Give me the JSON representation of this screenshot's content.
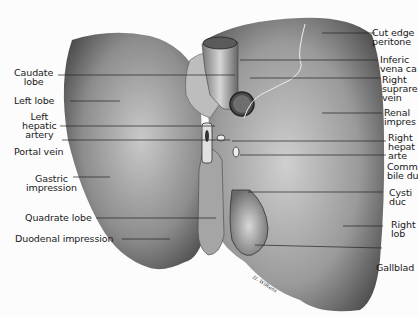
{
  "figure": {
    "signature": "H. Wilkens",
    "colors": {
      "background": "#fcfcfc",
      "organ_dark": "#3a3a3a",
      "organ_mid": "#8a8a8a",
      "organ_light": "#c8c8c8",
      "text": "#1a1a1a"
    }
  },
  "labels_left": [
    {
      "id": "caudate-lobe",
      "text": "Caudate\nlobe"
    },
    {
      "id": "left-lobe",
      "text": "Left lobe"
    },
    {
      "id": "left-hepatic-artery",
      "text": "Left\nhepatic\nartery"
    },
    {
      "id": "portal-vein",
      "text": "Portal vein"
    },
    {
      "id": "gastric-impression",
      "text": "Gastric\nimpression"
    },
    {
      "id": "quadrate-lobe",
      "text": "Quadrate lobe"
    },
    {
      "id": "duodenal-impression",
      "text": "Duodenal impression"
    }
  ],
  "labels_right": [
    {
      "id": "cut-edge-peritoneum",
      "text": "Cut edge\nperitone"
    },
    {
      "id": "inferior-vena-cava",
      "text": "Inferic\nvena ca"
    },
    {
      "id": "right-suprarenal-vein",
      "text": "Right\nsuprare\nvein"
    },
    {
      "id": "renal-impression",
      "text": "Renal\nimpres"
    },
    {
      "id": "right-hepatic-artery",
      "text": "Right\nhepat\narte"
    },
    {
      "id": "common-bile-duct",
      "text": "Comm\nbile du"
    },
    {
      "id": "cystic-duct",
      "text": "Cysti\nduc"
    },
    {
      "id": "right-lobe",
      "text": "Right\nlob"
    },
    {
      "id": "gallbladder",
      "text": "Gallblad"
    }
  ]
}
